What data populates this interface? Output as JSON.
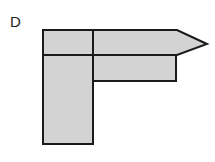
{
  "figure": {
    "label": "D",
    "fill_color": "#d3d3d3",
    "stroke_color": "#1a1a1a",
    "shapes": [
      {
        "name": "top-left-square",
        "points": "43,30 93,30 93,55 43,55"
      },
      {
        "name": "vertical-bar",
        "points": "43,55 93,55 93,144 43,144"
      },
      {
        "name": "arrow-head-bar",
        "points": "93,30 177,30 207,44 177,55 93,55"
      },
      {
        "name": "lower-horizontal-bar",
        "points": "93,55 176,55 176,81 93,81"
      }
    ]
  }
}
